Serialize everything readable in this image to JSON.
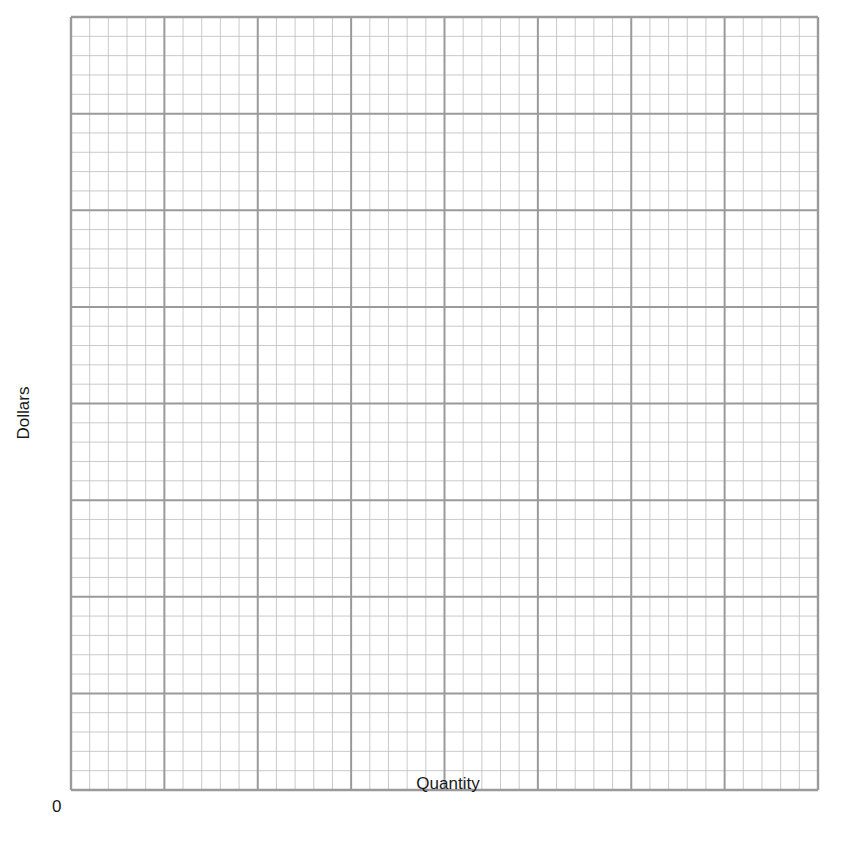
{
  "chart_data": {
    "type": "line",
    "title": "",
    "xlabel": "Quantity",
    "ylabel": "Dollars",
    "origin_label": "0",
    "series": [],
    "grid": true,
    "grid_spec": {
      "major_columns": 8,
      "major_rows": 8,
      "minor_per_major": 5
    },
    "x_tick_labels": [],
    "y_tick_labels": [],
    "legend": null
  },
  "colors": {
    "major_line": "#9a9a9a",
    "minor_line": "#bdbdbd",
    "background": "#ffffff",
    "text": "#1a1a1a"
  }
}
